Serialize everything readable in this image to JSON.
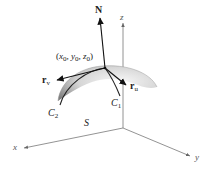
{
  "figure": {
    "type": "3d-parametric-surface-diagram",
    "surface_label": "S",
    "point_label": {
      "prefix": "(",
      "x": "x",
      "x_sub": "0",
      "y": "y",
      "y_sub": "0",
      "z": "z",
      "z_sub": "0",
      "sep": ", ",
      "suffix": ")"
    },
    "vectors": {
      "normal": {
        "label": "N"
      },
      "r_u": {
        "label": "r",
        "sub": "u"
      },
      "r_v": {
        "label": "r",
        "sub": "v"
      }
    },
    "curves": {
      "c1": {
        "label": "C",
        "sub": "1"
      },
      "c2": {
        "label": "C",
        "sub": "2"
      }
    },
    "axes": {
      "x": "x",
      "y": "y",
      "z": "z"
    },
    "colors": {
      "ink": "#222222",
      "axis": "#666666",
      "surface_dark": "#8a8a8a",
      "surface_light": "#f2f2f2"
    }
  }
}
